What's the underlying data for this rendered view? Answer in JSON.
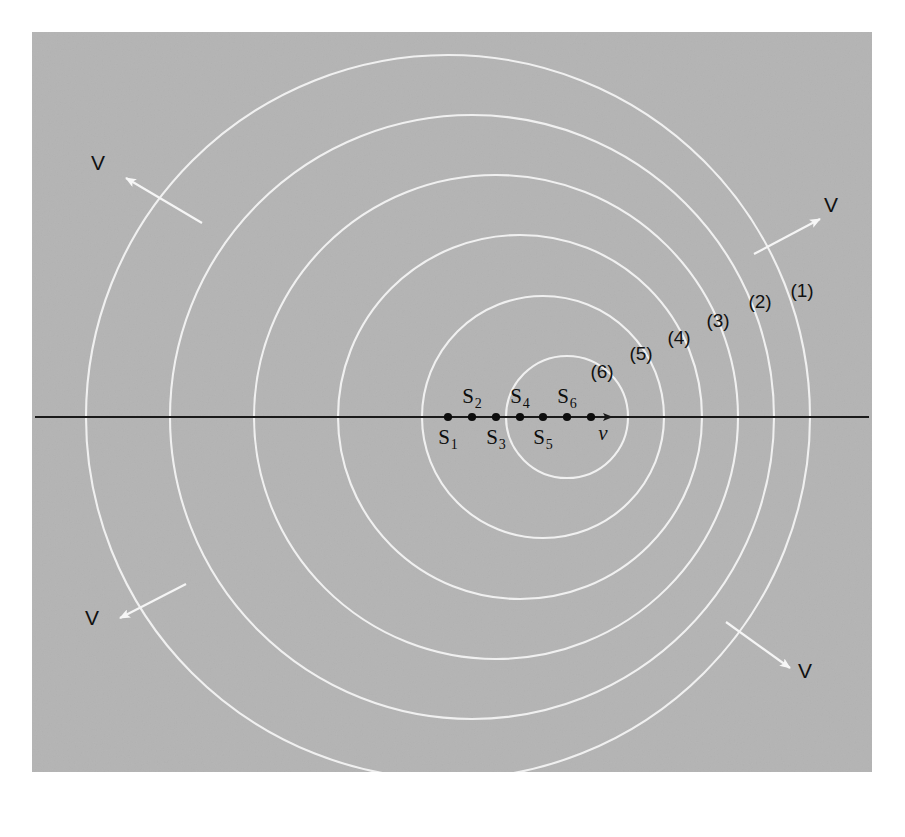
{
  "figure": {
    "panel": {
      "background_color": "#b4b4b4",
      "page_color": "#ffffff",
      "x": 32,
      "y": 32,
      "width": 840,
      "height": 740
    },
    "axis": {
      "label": "v",
      "color": "#1a1a1a",
      "y": 417,
      "x_start": 35,
      "x_end": 869,
      "arrow_tip_x": 612,
      "description": "horizontal line of motion with velocity arrow v"
    },
    "wave_color": "#f5f5f5",
    "sources": [
      {
        "id": "S1",
        "label": "S",
        "subscript": "1",
        "x": 448,
        "label_position": "below"
      },
      {
        "id": "S2",
        "label": "S",
        "subscript": "2",
        "x": 472,
        "label_position": "above"
      },
      {
        "id": "S3",
        "label": "S",
        "subscript": "3",
        "x": 496,
        "label_position": "below"
      },
      {
        "id": "S4",
        "label": "S",
        "subscript": "4",
        "x": 520,
        "label_position": "above"
      },
      {
        "id": "S5",
        "label": "S",
        "subscript": "5",
        "x": 543,
        "label_position": "below"
      },
      {
        "id": "S6",
        "label": "S",
        "subscript": "6",
        "x": 567,
        "label_position": "above"
      },
      {
        "id": "S7",
        "label": "",
        "subscript": "",
        "x": 591,
        "label_position": "none"
      }
    ],
    "wavefronts": [
      {
        "label": "(1)",
        "center_x": 448,
        "radius": 362,
        "label_x": 802,
        "label_y": 297
      },
      {
        "label": "(2)",
        "center_x": 472,
        "radius": 302,
        "label_x": 760,
        "label_y": 308
      },
      {
        "label": "(3)",
        "center_x": 496,
        "radius": 242,
        "label_x": 718,
        "label_y": 327
      },
      {
        "label": "(4)",
        "center_x": 520,
        "radius": 182,
        "label_x": 679,
        "label_y": 344
      },
      {
        "label": "(5)",
        "center_x": 543,
        "radius": 121,
        "label_x": 641,
        "label_y": 360
      },
      {
        "label": "(6)",
        "center_x": 567,
        "radius": 61,
        "label_x": 602,
        "label_y": 378
      }
    ],
    "velocity_arrows": [
      {
        "label": "V",
        "from_x": 202,
        "from_y": 223,
        "to_x": 126,
        "to_y": 178,
        "label_x": 98,
        "label_y": 170
      },
      {
        "label": "V",
        "from_x": 754,
        "from_y": 254,
        "to_x": 820,
        "to_y": 219,
        "label_x": 831,
        "label_y": 212
      },
      {
        "label": "V",
        "from_x": 186,
        "from_y": 584,
        "to_x": 120,
        "to_y": 618,
        "label_x": 92,
        "label_y": 625
      },
      {
        "label": "V",
        "from_x": 726,
        "from_y": 622,
        "to_x": 790,
        "to_y": 668,
        "label_x": 805,
        "label_y": 678
      }
    ],
    "bleed_text": ""
  },
  "chart_data": {
    "type": "scatter",
    "xlabel": "",
    "ylabel": "",
    "series": [
      {
        "name": "source positions",
        "labels": [
          "S1",
          "S2",
          "S3",
          "S4",
          "S5",
          "S6"
        ],
        "x": [
          448,
          472,
          496,
          520,
          543,
          567
        ],
        "y": [
          417,
          417,
          417,
          417,
          417,
          417
        ]
      },
      {
        "name": "wavefront radii",
        "labels": [
          "(1)",
          "(2)",
          "(3)",
          "(4)",
          "(5)",
          "(6)"
        ],
        "values": [
          362,
          302,
          242,
          182,
          121,
          61
        ]
      }
    ],
    "annotations": [
      "V",
      "V",
      "V",
      "V",
      "v"
    ],
    "legend": "none",
    "grid": false
  }
}
